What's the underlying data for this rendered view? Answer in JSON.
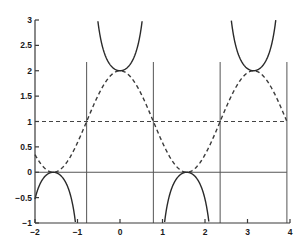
{
  "chart_data": {
    "type": "line",
    "title": "",
    "xlabel": "",
    "ylabel": "",
    "xlim": [
      -2,
      4
    ],
    "ylim": [
      -1,
      3
    ],
    "xticks": [
      -2,
      -1,
      0,
      1,
      2,
      3,
      4
    ],
    "xtick_labels": [
      "−2",
      "−1",
      "0",
      "1",
      "2",
      "3",
      "4"
    ],
    "yticks": [
      -1,
      -0.5,
      0,
      0.5,
      1,
      1.5,
      2,
      2.5,
      3
    ],
    "ytick_labels": [
      "−1",
      "−0.5",
      "0",
      "0.5",
      "1",
      "1.5",
      "2",
      "2.5",
      "3"
    ],
    "grid": false,
    "legend": null,
    "series": [
      {
        "name": "y = 1 + sec(2x)",
        "style": "solid",
        "description": "Branches of 1 + sec(2x); minima at y=2 (x=0, π), maxima at y=0 (x=−π/2, π/2)",
        "sample_points": [
          [
            -2,
            -0.53
          ],
          [
            -1.571,
            0
          ],
          [
            -1.1,
            -1.0
          ],
          [
            -0.6,
            3.8
          ],
          [
            0,
            2
          ],
          [
            0.6,
            3.8
          ],
          [
            1.1,
            -1.0
          ],
          [
            1.571,
            0
          ],
          [
            2.0,
            -0.53
          ],
          [
            2.6,
            3.0
          ],
          [
            3.1416,
            2
          ],
          [
            3.6,
            3.3
          ]
        ]
      },
      {
        "name": "y = 1 + cos(2x)",
        "style": "dashed",
        "sample_points": [
          [
            -2,
            0.35
          ],
          [
            -1.571,
            0
          ],
          [
            -1,
            0.58
          ],
          [
            -0.785,
            1
          ],
          [
            0,
            2
          ],
          [
            0.785,
            1
          ],
          [
            1.571,
            0
          ],
          [
            2.356,
            1
          ],
          [
            3.1416,
            2
          ],
          [
            3.927,
            1
          ],
          [
            4,
            0.85
          ]
        ]
      },
      {
        "name": "y = 1",
        "style": "dashed",
        "sample_points": [
          [
            -2,
            1
          ],
          [
            4,
            1
          ]
        ]
      },
      {
        "name": "y = 0",
        "style": "solid",
        "sample_points": [
          [
            -2,
            0
          ],
          [
            3.927,
            0
          ]
        ]
      }
    ],
    "vertical_asymptotes": [
      -0.785,
      0.785,
      2.356,
      3.927
    ]
  }
}
